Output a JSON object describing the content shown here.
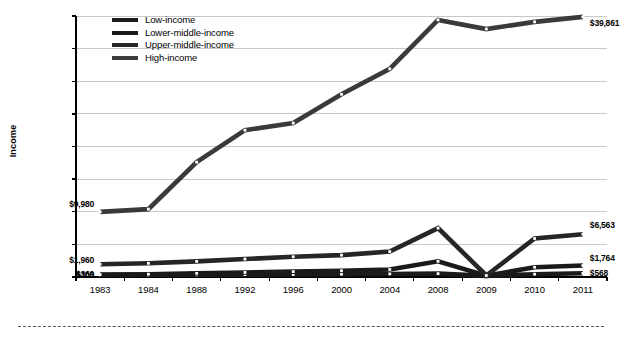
{
  "chart_data": {
    "type": "line",
    "title": "",
    "xlabel": "",
    "ylabel": "Income",
    "categories": [
      "1983",
      "1984",
      "1988",
      "1992",
      "1996",
      "2000",
      "2004",
      "2008",
      "2009",
      "2010",
      "2011"
    ],
    "ylim": [
      0,
      40000
    ],
    "ytick_step": 5000,
    "ytick_labels": [
      "$0",
      "$5,000",
      "$10,000",
      "$15,000",
      "$20,000",
      "$25,000",
      "$30,000",
      "$35,000",
      "$40,000"
    ],
    "ytick_values": [
      0,
      5000,
      10000,
      15000,
      20000,
      25000,
      30000,
      35000,
      40000
    ],
    "grid": true,
    "legend_position": "top-left",
    "series": [
      {
        "name": "Low-income",
        "color": "#1a1a1a",
        "values": [
          300,
          310,
          330,
          360,
          390,
          420,
          470,
          520,
          180,
          430,
          568
        ],
        "start_label": "$300",
        "end_label": "$568"
      },
      {
        "name": "Lower-middle-income",
        "color": "#1a1a1a",
        "values": [
          369,
          430,
          560,
          700,
          830,
          960,
          1150,
          2400,
          190,
          1500,
          1764
        ],
        "start_label": "$369",
        "end_label": "$1,764"
      },
      {
        "name": "Upper-middle-income",
        "color": "#262626",
        "values": [
          1960,
          2100,
          2400,
          2750,
          3100,
          3350,
          3900,
          7500,
          230,
          5900,
          6563
        ],
        "start_label": "$1,960",
        "end_label": "$6,563"
      },
      {
        "name": "High-income",
        "color": "#3a3a3a",
        "values": [
          9980,
          10400,
          17600,
          22500,
          23600,
          28000,
          31900,
          39400,
          38000,
          39100,
          39861
        ],
        "start_label": "$9,980",
        "end_label": "$39,861"
      }
    ]
  },
  "legend": {
    "items": [
      {
        "label": "Low-income"
      },
      {
        "label": "Lower-middle-income"
      },
      {
        "label": "Upper-middle-income"
      },
      {
        "label": "High-income"
      }
    ]
  }
}
